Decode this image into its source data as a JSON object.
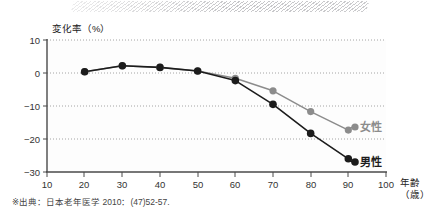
{
  "chart_data": {
    "type": "line",
    "title": "",
    "xlabel": "年齢（歳）",
    "ylabel": "変化率（%）",
    "x": [
      20,
      30,
      40,
      50,
      60,
      70,
      80,
      90
    ],
    "xlim": [
      10,
      100
    ],
    "ylim": [
      -30,
      10
    ],
    "xticks": [
      "10",
      "20",
      "30",
      "40",
      "50",
      "60",
      "70",
      "80",
      "90",
      "100"
    ],
    "yticks": [
      "10",
      "0",
      "-10",
      "-20",
      "-30"
    ],
    "grid": true,
    "legend_position": "inline-right-end",
    "series": [
      {
        "name": "女性",
        "color": "#8c8c8c",
        "values": [
          0.4,
          2.2,
          1.7,
          0.6,
          -1.6,
          -5.4,
          -11.7,
          -17.3
        ]
      },
      {
        "name": "男性",
        "color": "#1c1c1c",
        "values": [
          0.4,
          2.2,
          1.7,
          0.6,
          -2.3,
          -9.5,
          -18.3,
          -26.0
        ]
      }
    ],
    "annotations": [
      {
        "text": "女性",
        "series": "女性",
        "at_x": 90
      },
      {
        "text": "男性",
        "series": "男性",
        "at_x": 90
      }
    ]
  },
  "axis": {
    "y_title": "変化率（%）",
    "x_title_line1": "年齢",
    "x_title_line2": "（歳）",
    "y_tick_10": "10",
    "y_tick_0": "0",
    "y_tick_m10": "−10",
    "y_tick_m20": "−20",
    "y_tick_m30": "−30",
    "x_tick_10": "10",
    "x_tick_20": "20",
    "x_tick_30": "30",
    "x_tick_40": "40",
    "x_tick_50": "50",
    "x_tick_60": "60",
    "x_tick_70": "70",
    "x_tick_80": "80",
    "x_tick_90": "90",
    "x_tick_100": "100"
  },
  "legend": {
    "female_label": "女性",
    "male_label": "男性"
  },
  "footer": {
    "source_note": "※出典：日本老年医学 2010：(47)52-57."
  },
  "colors": {
    "female": "#8c8c8c",
    "male": "#1c1c1c",
    "axis": "#4a4a4a",
    "grid": "#9a9a9a",
    "band": "#96969b"
  }
}
